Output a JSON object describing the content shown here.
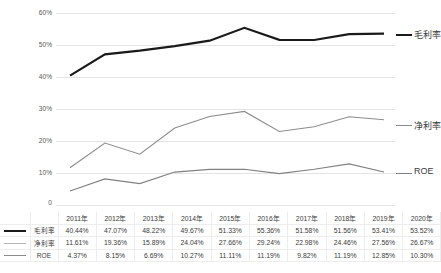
{
  "chart_data": {
    "type": "line",
    "title": "",
    "xlabel": "",
    "ylabel": "",
    "ylim": [
      0,
      60
    ],
    "yticks": [
      "0",
      "10%",
      "20%",
      "30%",
      "40%",
      "50%",
      "60%"
    ],
    "grid": true,
    "legend_position": "right-of-plot",
    "categories": [
      "2011年",
      "2012年",
      "2013年",
      "2014年",
      "2015年",
      "2016年",
      "2017年",
      "2018年",
      "2019年",
      "2020年"
    ],
    "series": [
      {
        "name": "毛利率",
        "color": "#1a1a1a",
        "width": 2.2,
        "values": [
          40.44,
          47.07,
          48.22,
          49.67,
          51.33,
          55.36,
          51.58,
          51.56,
          53.41,
          53.52
        ],
        "labels": [
          "40.44%",
          "47.07%",
          "48.22%",
          "49.67%",
          "51.33%",
          "55.36%",
          "51.58%",
          "51.56%",
          "53.41%",
          "53.52%"
        ]
      },
      {
        "name": "净利率",
        "color": "#8c8c8c",
        "width": 1.1,
        "values": [
          11.61,
          19.36,
          15.89,
          24.04,
          27.66,
          29.24,
          22.98,
          24.46,
          27.56,
          26.67
        ],
        "labels": [
          "11.61%",
          "19.36%",
          "15.89%",
          "24.04%",
          "27.66%",
          "29.24%",
          "22.98%",
          "24.46%",
          "27.56%",
          "26.67%"
        ]
      },
      {
        "name": "ROE",
        "color": "#808080",
        "width": 1.1,
        "values": [
          4.37,
          8.15,
          6.69,
          10.27,
          11.11,
          11.19,
          9.82,
          11.19,
          12.85,
          10.3
        ],
        "labels": [
          "4.37%",
          "8.15%",
          "6.69%",
          "10.27%",
          "11.11%",
          "11.19%",
          "9.82%",
          "11.19%",
          "12.85%",
          "10.30%"
        ]
      }
    ]
  },
  "axis": {
    "y": {
      "t60": "60%",
      "t50": "50%",
      "t40": "40%",
      "t30": "30%",
      "t20": "20%",
      "t10": "10%",
      "t0": "0"
    }
  },
  "series_labels": {
    "gross": "毛利率",
    "net": "净利率",
    "roe": "ROE"
  },
  "table": {
    "header": [
      "2011年",
      "2012年",
      "2013年",
      "2014年",
      "2015年",
      "2016年",
      "2017年",
      "2018年",
      "2019年",
      "2020年"
    ],
    "rows": [
      {
        "name": "毛利率",
        "values": [
          "40.44%",
          "47.07%",
          "48.22%",
          "49.67%",
          "51.33%",
          "55.36%",
          "51.58%",
          "51.56%",
          "53.41%",
          "53.52%"
        ]
      },
      {
        "name": "净利率",
        "values": [
          "11.61%",
          "19.36%",
          "15.89%",
          "24.04%",
          "27.66%",
          "29.24%",
          "22.98%",
          "24.46%",
          "27.56%",
          "26.67%"
        ]
      },
      {
        "name": "ROE",
        "values": [
          "4.37%",
          "8.15%",
          "6.69%",
          "10.27%",
          "11.11%",
          "11.19%",
          "9.82%",
          "11.19%",
          "12.85%",
          "10.30%"
        ]
      }
    ]
  }
}
